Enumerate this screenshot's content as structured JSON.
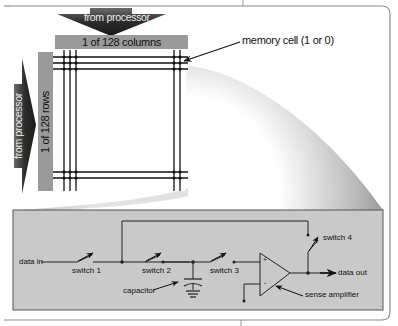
{
  "diagram": {
    "top_arrow": {
      "label": "from processor"
    },
    "columns_bar": {
      "label": "1 of 128 columns"
    },
    "left_arrow": {
      "label": "from processor"
    },
    "rows_bar": {
      "label": "1 of 128 rows"
    },
    "callout": {
      "label": "memory cell (1 or 0)"
    },
    "circuit": {
      "data_in": "data in",
      "switch1": "switch 1",
      "switch2": "switch 2",
      "switch3": "switch 3",
      "switch4": "switch 4",
      "capacitor": "capacitor",
      "data_out": "data out",
      "sense_amplifier": "sense amplifier",
      "plus": "+",
      "minus": "-"
    },
    "colors": {
      "arrow_dark": "#333333",
      "bar_gray": "#9a9a9a",
      "panel_fill": "#c9c9c9",
      "panel_border": "#555555",
      "line": "#111111",
      "frame": "#888888"
    }
  }
}
